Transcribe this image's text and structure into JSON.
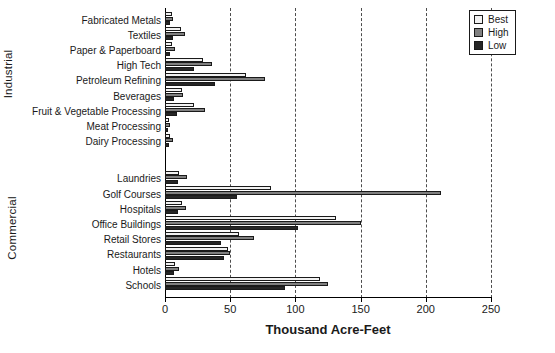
{
  "chart_data": {
    "type": "bar",
    "orientation": "horizontal",
    "title": "",
    "xlabel": "Thousand Acre-Feet",
    "ylabel": "",
    "xlim": [
      0,
      250
    ],
    "xticks": [
      0,
      50,
      100,
      150,
      200,
      250
    ],
    "xtick_labels": [
      "0",
      "50",
      "100",
      "150",
      "200",
      "250"
    ],
    "grid": "vertical-dashed",
    "legend_position": "top-right",
    "series": [
      {
        "name": "Best",
        "color": "#f2f2f2"
      },
      {
        "name": "High",
        "color": "#808080"
      },
      {
        "name": "Low",
        "color": "#262626"
      }
    ],
    "groups": [
      {
        "label": "Industrial",
        "categories": [
          "Fabricated Metals",
          "Textiles",
          "Paper & Paperboard",
          "High Tech",
          "Petroleum Refining",
          "Beverages",
          "Fruit & Vegetable Processing",
          "Meat Processing",
          "Dairy Processing"
        ],
        "values": {
          "Best": [
            5,
            12,
            5,
            29,
            62,
            13,
            22,
            3,
            4
          ],
          "High": [
            6,
            15,
            8,
            36,
            77,
            14,
            31,
            4,
            6
          ],
          "Low": [
            4,
            6,
            4,
            22,
            38,
            7,
            9,
            2,
            3
          ]
        }
      },
      {
        "label": "Commercial",
        "categories": [
          "Laundries",
          "Golf Courses",
          "Hospitals",
          "Office Buildings",
          "Retail Stores",
          "Restaurants",
          "Hotels",
          "Schools"
        ],
        "values": {
          "Best": [
            11,
            81,
            13,
            131,
            57,
            48,
            8,
            119
          ],
          "High": [
            17,
            212,
            16,
            150,
            68,
            50,
            11,
            125
          ],
          "Low": [
            10,
            55,
            10,
            102,
            43,
            45,
            7,
            92
          ]
        }
      }
    ]
  },
  "legend": {
    "items": [
      {
        "label": "Best"
      },
      {
        "label": "High"
      },
      {
        "label": "Low"
      }
    ]
  },
  "axis": {
    "x_title": "Thousand Acre-Feet"
  }
}
